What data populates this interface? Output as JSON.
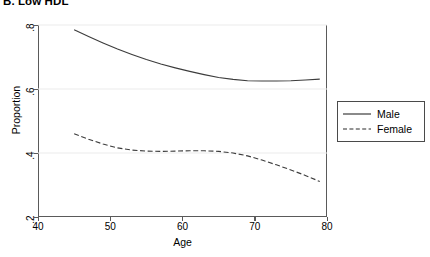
{
  "panel": {
    "title": "B. Low HDL"
  },
  "legend": {
    "items": [
      {
        "label": "Male",
        "style": "solid"
      },
      {
        "label": "Female",
        "style": "dashed"
      }
    ]
  },
  "chart_data": {
    "type": "line",
    "title": "B. Low HDL",
    "xlabel": "Age",
    "ylabel": "Proportion",
    "xlim": [
      40,
      80
    ],
    "ylim": [
      0.2,
      0.8
    ],
    "xticks": [
      40,
      50,
      60,
      70,
      80
    ],
    "xtick_labels": [
      "40",
      "50",
      "60",
      "70",
      "80"
    ],
    "yticks": [
      0.2,
      0.4,
      0.6,
      0.8
    ],
    "ytick_labels": [
      ".2",
      ".4",
      ".6",
      ".8"
    ],
    "grid": "horizontal",
    "legend_position": "right",
    "series": [
      {
        "name": "Male",
        "style": "solid",
        "color": "#3c3c3c",
        "x": [
          45,
          47,
          49,
          51,
          53,
          55,
          57,
          59,
          61,
          63,
          65,
          67,
          69,
          71,
          73,
          75,
          77,
          79
        ],
        "y": [
          0.785,
          0.764,
          0.744,
          0.725,
          0.708,
          0.692,
          0.678,
          0.666,
          0.655,
          0.645,
          0.636,
          0.63,
          0.626,
          0.625,
          0.625,
          0.626,
          0.628,
          0.631
        ]
      },
      {
        "name": "Female",
        "style": "dashed",
        "color": "#3c3c3c",
        "x": [
          45,
          47,
          49,
          51,
          53,
          55,
          57,
          59,
          61,
          63,
          65,
          67,
          69,
          71,
          73,
          75,
          77,
          79
        ],
        "y": [
          0.46,
          0.443,
          0.428,
          0.416,
          0.409,
          0.406,
          0.405,
          0.406,
          0.407,
          0.407,
          0.405,
          0.4,
          0.391,
          0.378,
          0.363,
          0.347,
          0.33,
          0.311
        ]
      }
    ]
  }
}
